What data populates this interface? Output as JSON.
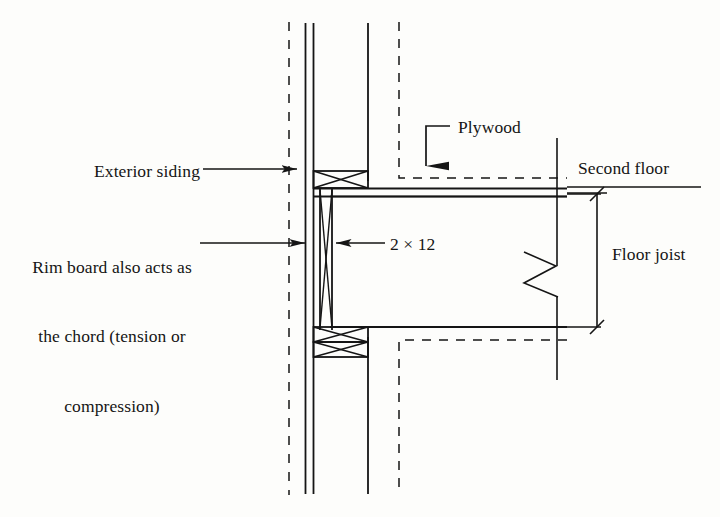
{
  "figure": {
    "type": "construction-section-diagram",
    "background_color": "#fdfdfb",
    "line_color": "#151515",
    "text_color": "#151515"
  },
  "labels": {
    "exterior_siding": "Exterior siding",
    "rim_board_line1": "Rim board also acts as",
    "rim_board_line2": "the chord (tension or",
    "rim_board_line3": "compression)",
    "plywood": "Plywood",
    "lumber_size": "2 × 12",
    "second_floor": "Second floor",
    "floor_joist": "Floor joist"
  },
  "components": [
    {
      "name": "exterior-siding",
      "label": "Exterior siding",
      "pointer": "arrow-right"
    },
    {
      "name": "rim-board-chord",
      "label": "Rim board also acts as the chord (tension or compression)",
      "pointer": "arrow-right"
    },
    {
      "name": "plywood-sheathing",
      "label": "Plywood",
      "pointer": "arrow-down"
    },
    {
      "name": "joist-lumber",
      "label": "2 × 12",
      "pointer": "arrow-left"
    },
    {
      "name": "second-floor-level",
      "label": "Second floor",
      "pointer": "leader-line"
    },
    {
      "name": "floor-joist-depth",
      "label": "Floor joist",
      "pointer": "dimension-line"
    }
  ],
  "icons": {
    "arrow_right": "arrow-right-icon",
    "arrow_left": "arrow-left-icon",
    "arrow_down": "arrow-down-icon",
    "break_symbol": "break-line-icon",
    "cross_hatch": "cross-hatch-icon",
    "dimension_tick": "dimension-tick-icon"
  }
}
